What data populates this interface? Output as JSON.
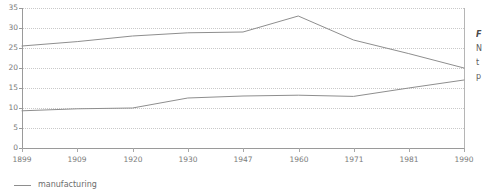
{
  "chart_data": {
    "type": "line",
    "title": "",
    "xlabel": "",
    "ylabel": "",
    "categories": [
      "1899",
      "1909",
      "1920",
      "1930",
      "1947",
      "1960",
      "1971",
      "1981",
      "1990"
    ],
    "ylim": [
      0,
      35
    ],
    "yticks": [
      0,
      5,
      10,
      15,
      20,
      25,
      30,
      35
    ],
    "grid": true,
    "legend_position": "bottom-left",
    "series": [
      {
        "name": "upper-series",
        "label": "",
        "color": "#8e8e8e",
        "values": [
          25.5,
          26.6,
          28.0,
          28.8,
          29.0,
          33.0,
          27.0,
          23.6,
          20.0
        ]
      },
      {
        "name": "manufacturing",
        "label": "manufacturing",
        "color": "#8e8e8e",
        "values": [
          9.3,
          9.8,
          10.0,
          12.5,
          13.0,
          13.2,
          12.9,
          15.0,
          17.0
        ]
      }
    ]
  },
  "axis": {
    "y_tick_labels": [
      "35",
      "30",
      "25",
      "20",
      "15",
      "10",
      "5",
      "0"
    ],
    "x_tick_labels": [
      "1899",
      "1909",
      "1920",
      "1930",
      "1947",
      "1960",
      "1971",
      "1981",
      "1990"
    ]
  },
  "legend": {
    "entries": [
      {
        "label": "manufacturing",
        "swatch": "line-swatch"
      }
    ]
  },
  "caption": {
    "title": "F",
    "lines": [
      "N",
      "t",
      "p"
    ]
  }
}
